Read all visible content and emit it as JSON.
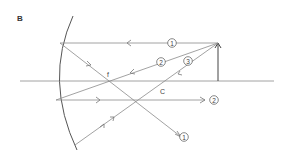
{
  "panel_label": "B",
  "labels": {
    "focal_point": "f",
    "center_of_curvature": "C"
  },
  "rays": [
    {
      "id": "ray-1",
      "marker": "1"
    },
    {
      "id": "ray-2",
      "marker": "2"
    },
    {
      "id": "ray-3",
      "marker": "3"
    }
  ],
  "colors": {
    "line": "#8a8a8a",
    "mirror": "#555555",
    "object": "#444444",
    "text": "#444444"
  }
}
